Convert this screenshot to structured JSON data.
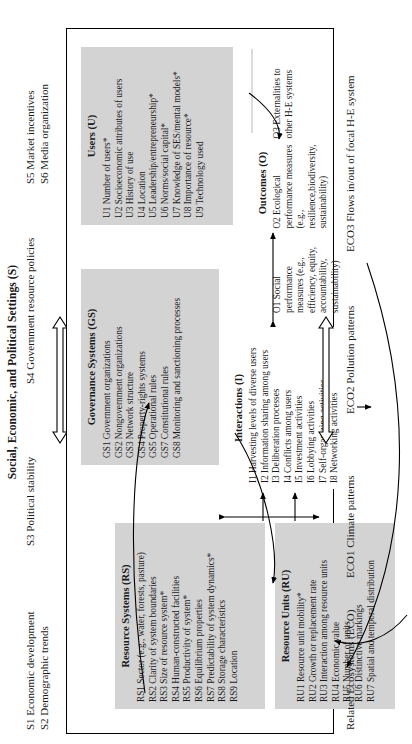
{
  "settings": {
    "title": "Social, Economic, and Political Settings (S)",
    "left": [
      "S1 Economic development",
      "S2 Demographic trends"
    ],
    "mid": [
      "S3 Political stability"
    ],
    "mid2": [
      "S4 Government resource policies"
    ],
    "right": [
      "S5 Market incentives",
      "S6 Media organization"
    ]
  },
  "resource_systems": {
    "title": "Resource Systems (RS)",
    "items": [
      "RS1 Sector (e.g., water, forests, pasture)",
      "RS2 Clarity of system boundaries",
      "RS3 Size of resource system*",
      "RS4 Human-constructed facilities",
      "RS5 Productivity of system*",
      "RS6 Equilibrium properties",
      "RS7 Predictability of system dynamics*",
      "RS8 Storage characteristics",
      "RS9 Location"
    ]
  },
  "resource_units": {
    "title": "Resource Units (RU)",
    "items": [
      "RU1 Resource unit mobility*",
      "RU2 Growth or replacement rate",
      "RU3 Interaction among resource units",
      "RU4 Economic value",
      "RU5 Number of units",
      "RU6 Distinctive markings",
      "RU7 Spatial and temporal distribution"
    ]
  },
  "governance_systems": {
    "title": "Governance Systems (GS)",
    "items": [
      "GS1 Government organizations",
      "GS2 Nongovernment organizations",
      "GS3 Network structure",
      "GS4 Property-rights systems",
      "GS5 Operational rules",
      "GS7 Constitutional rules",
      "GS8 Monitoring and sanctioning processes"
    ]
  },
  "users": {
    "title": "Users (U)",
    "items": [
      "U1 Number of users*",
      "U2 Socioeconomic attributes of users",
      "U3 History of use",
      "U4 Location",
      "U5 Leadership/entrepreneurship*",
      "U6 Norms/social capital*",
      "U7 Knowledge of SES/mental models*",
      "U8 Importance of resource*",
      "U9 Technology used"
    ]
  },
  "interactions": {
    "title": "Interactions (I)",
    "items": [
      "I1 Harvesting levels of diverse users",
      "I2 Information sharing among users",
      "I3 Deliberation processes",
      "I4 Conflicts among users",
      "I5 Investment activities",
      "I6 Lobbying activities",
      "I7 Self-organizing activities",
      "I8 Networking activities"
    ]
  },
  "outcomes": {
    "title": "Outcomes (O)",
    "o1": "O1 Social performance measures (e.g., efficiency, equity, accountability, sustainability)",
    "o2": "O2 Ecological performance measures (e.g., resilience,biodiversity, sustainability)",
    "o3": "O3 Externalities to other H-E systems"
  },
  "ecosystems": {
    "label": "Related Ecosystems (ECO)",
    "eco1": "ECO1 Climate patterns",
    "eco2": "ECO2 Pollution patterns",
    "eco3": "ECO3 Flows in/out of focal H-E system"
  },
  "colors": {
    "shade": "#d3d3d3",
    "shade_light": "#dcdcdc",
    "line": "#000000",
    "background": "#ffffff"
  }
}
